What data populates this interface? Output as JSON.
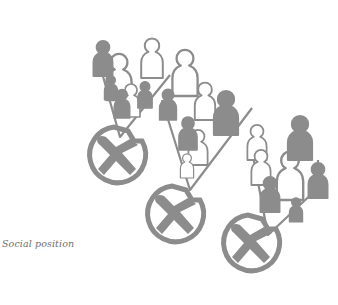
{
  "figure": {
    "caption": "Social position",
    "colors": {
      "ink": "#8c8c8c",
      "background": "#ffffff",
      "caption": "#6e6e6e"
    },
    "groups": [
      {
        "name": "group-1",
        "people_outlined": 3,
        "people_filled": 4,
        "wheel": "wheel-1"
      },
      {
        "name": "group-2",
        "people_outlined": 4,
        "people_filled": 3,
        "wheel": "wheel-2"
      },
      {
        "name": "group-3",
        "people_outlined": 3,
        "people_filled": 4,
        "wheel": "wheel-3"
      }
    ]
  }
}
